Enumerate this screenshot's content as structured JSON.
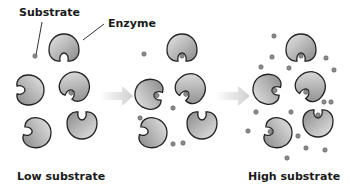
{
  "diagram": {
    "labels": {
      "substrate": "Substrate",
      "enzyme": "Enzyme",
      "low": "Low substrate",
      "high": "High substrate"
    },
    "colors": {
      "enzyme_fill_light": "#d9d9d9",
      "enzyme_fill_dark": "#8a8a8a",
      "enzyme_stroke": "#222222",
      "substrate_fill": "#8c8c8c",
      "arrow_fill": "#d8d8d8",
      "text": "#1a1a1a"
    },
    "panels": [
      {
        "name": "low-substrate",
        "enzymes": 5,
        "bound": 1
      },
      {
        "name": "medium-substrate",
        "enzymes": 5,
        "bound": 3
      },
      {
        "name": "high-substrate",
        "enzymes": 5,
        "bound": 5
      }
    ]
  }
}
